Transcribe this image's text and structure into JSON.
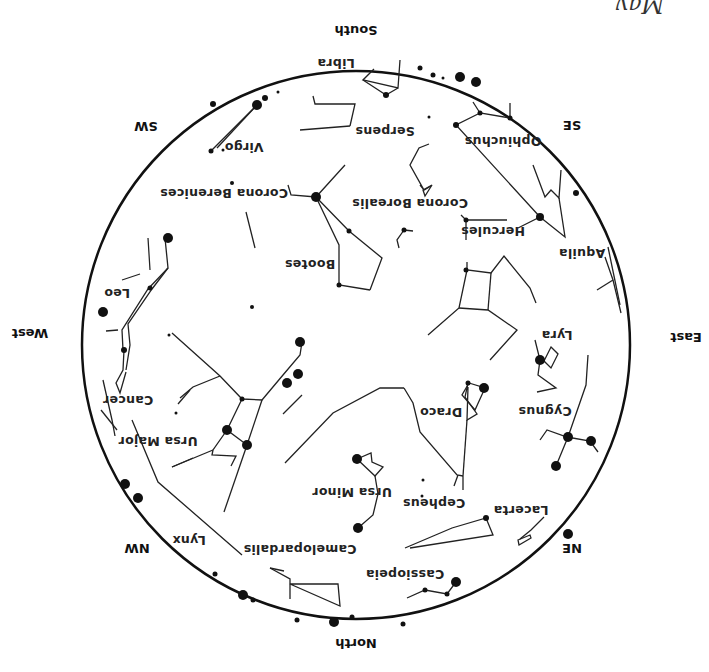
{
  "title_partial": "May",
  "directions": [
    {
      "label": "South",
      "x": 356,
      "y": 35
    },
    {
      "label": "SE",
      "x": 572,
      "y": 130
    },
    {
      "label": "East",
      "x": 686,
      "y": 342
    },
    {
      "label": "NE",
      "x": 572,
      "y": 553
    },
    {
      "label": "North",
      "x": 356,
      "y": 648
    },
    {
      "label": "NW",
      "x": 137,
      "y": 553
    },
    {
      "label": "West",
      "x": 30,
      "y": 338
    },
    {
      "label": "SW",
      "x": 146,
      "y": 131
    }
  ],
  "constellations": [
    {
      "label": "Libra",
      "x": 336,
      "y": 67
    },
    {
      "label": "Serpens",
      "x": 385,
      "y": 135
    },
    {
      "label": "Ophiuchus",
      "x": 503,
      "y": 145
    },
    {
      "label": "Virgo",
      "x": 244,
      "y": 151
    },
    {
      "label": "Corona Berenices",
      "x": 224,
      "y": 197
    },
    {
      "label": "Corona Borealis",
      "x": 410,
      "y": 207
    },
    {
      "label": "Hercules",
      "x": 493,
      "y": 235
    },
    {
      "label": "Aquila",
      "x": 582,
      "y": 257
    },
    {
      "label": "Bootes",
      "x": 310,
      "y": 268
    },
    {
      "label": "Leo",
      "x": 117,
      "y": 297
    },
    {
      "label": "Lyra",
      "x": 557,
      "y": 339
    },
    {
      "label": "Cancer",
      "x": 128,
      "y": 404
    },
    {
      "label": "Draco",
      "x": 441,
      "y": 416
    },
    {
      "label": "Cygnus",
      "x": 545,
      "y": 415
    },
    {
      "label": "Ursa Major",
      "x": 158,
      "y": 445
    },
    {
      "label": "Ursa Minor",
      "x": 352,
      "y": 496
    },
    {
      "label": "Cepheus",
      "x": 434,
      "y": 507
    },
    {
      "label": "Lacerta",
      "x": 521,
      "y": 514
    },
    {
      "label": "Lynx",
      "x": 189,
      "y": 544
    },
    {
      "label": "Camelopardalis",
      "x": 300,
      "y": 553
    },
    {
      "label": "Cassiopeia",
      "x": 405,
      "y": 578
    }
  ],
  "horizon": {
    "cx": 356,
    "cy": 345,
    "r": 274
  }
}
